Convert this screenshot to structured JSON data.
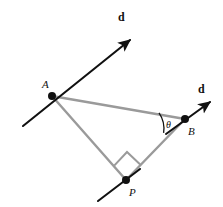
{
  "figure": {
    "background_color": "#ffffff",
    "line_color_ray": "#111111",
    "line_color_triangle": "#9a9a9a",
    "point_color": "#111111",
    "width": 223,
    "height": 207,
    "points": [
      {
        "id": "A",
        "label": "A",
        "x": 52,
        "y": 96,
        "label_x": 42,
        "label_y": 79
      },
      {
        "id": "B",
        "label": "B",
        "x": 185,
        "y": 119,
        "label_x": 188,
        "label_y": 126
      },
      {
        "id": "P",
        "label": "P",
        "x": 126,
        "y": 180,
        "label_x": 129,
        "label_y": 187
      }
    ],
    "vectors": [
      {
        "id": "d-at-A",
        "label": "d",
        "label_x": 118,
        "label_y": 11,
        "tail_x": 23,
        "tail_y": 126,
        "head_x": 130,
        "head_y": 40
      },
      {
        "id": "d-at-B",
        "label": "d",
        "label_x": 198,
        "label_y": 83,
        "tail_x": 166,
        "tail_y": 134,
        "head_x": 210,
        "head_y": 102
      }
    ],
    "segments": [
      {
        "id": "A-B",
        "from": "A",
        "to": "B"
      },
      {
        "id": "A-P",
        "from": "A",
        "to": "P"
      },
      {
        "id": "P-B",
        "from": "P",
        "to": "B"
      }
    ],
    "extra_line": {
      "id": "line-through-P",
      "x1": 98,
      "y1": 201,
      "x2": 140,
      "y2": 169
    },
    "angle": {
      "id": "theta-at-B",
      "label": "θ",
      "vertex": "B",
      "label_x": 166,
      "label_y": 120,
      "arc_path": "M 159.0 112.8 A 28 28 0 0 1 163.6 132.9"
    },
    "right_angle": {
      "id": "right-angle-at-P",
      "vertex": "P",
      "path": "M 114.2 165.6 L 127.0 152.0 L 140.2 164.5"
    }
  }
}
